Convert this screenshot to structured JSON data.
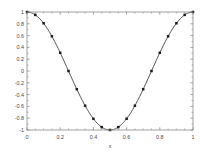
{
  "chart_data": {
    "type": "line",
    "title": "",
    "xlabel": "x",
    "ylabel": "",
    "xlim": [
      0,
      1
    ],
    "ylim": [
      -1,
      1
    ],
    "grid": false,
    "legend": null,
    "marker": "filled-square",
    "line_color": "#3a3a3a",
    "marker_color": "#1a1a1a",
    "xticks": [
      0,
      0.2,
      0.4,
      0.6,
      0.8,
      1
    ],
    "xticklabels": [
      "0",
      "0.2",
      "0.4",
      "0.6",
      "0.8",
      "1"
    ],
    "yticks": [
      -1,
      -0.8,
      -0.6,
      -0.4,
      -0.2,
      0,
      0.2,
      0.4,
      0.6,
      0.8,
      1
    ],
    "yticklabels": [
      "-1",
      "-0.8",
      "-0.6",
      "-0.4",
      "-0.2",
      "0",
      "0.2",
      "0.4",
      "0.6",
      "0.8",
      "1"
    ],
    "series": [
      {
        "name": "cos(2*pi*x)",
        "x": [
          0,
          0.05,
          0.1,
          0.15,
          0.2,
          0.25,
          0.3,
          0.35,
          0.4,
          0.45,
          0.5,
          0.55,
          0.6,
          0.65,
          0.7,
          0.75,
          0.8,
          0.85,
          0.9,
          0.95,
          1
        ],
        "values": [
          1,
          0.951,
          0.809,
          0.588,
          0.309,
          0,
          -0.309,
          -0.588,
          -0.809,
          -0.951,
          -1,
          -0.951,
          -0.809,
          -0.588,
          -0.309,
          0,
          0.309,
          0.588,
          0.809,
          0.951,
          1
        ]
      }
    ]
  },
  "axes": {
    "box": true,
    "tick_direction": "in",
    "minor_ticks_x": [
      0.05,
      0.1,
      0.15,
      0.25,
      0.3,
      0.35,
      0.45,
      0.5,
      0.55,
      0.65,
      0.7,
      0.75,
      0.85,
      0.9,
      0.95
    ],
    "axis_color": "#8a8a8a",
    "background": "#ffffff"
  }
}
